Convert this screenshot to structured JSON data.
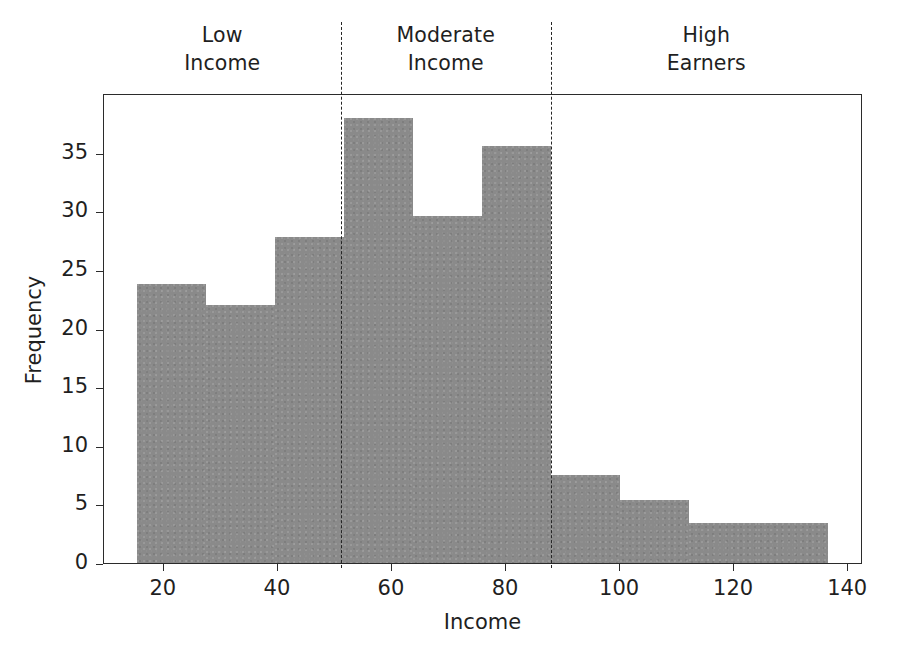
{
  "chart_data": {
    "type": "bar",
    "chart_subtype": "histogram",
    "title": "",
    "xlabel": "Income",
    "ylabel": "Frequency",
    "xlim": [
      9.5,
      142.6
    ],
    "ylim": [
      0,
      40.1
    ],
    "grid": false,
    "legend": null,
    "bar_color": "#8a8a8a",
    "bin_edges": [
      15.2,
      27.3,
      39.4,
      51.5,
      63.6,
      75.7,
      87.8,
      99.9,
      112.0,
      124.1,
      136.5
    ],
    "bin_centers": [
      21.2,
      33.3,
      45.4,
      57.5,
      69.6,
      81.7,
      93.8,
      105.9,
      118.0,
      130.3
    ],
    "values": [
      23.8,
      22.0,
      27.8,
      38.0,
      29.6,
      35.6,
      7.5,
      5.4,
      3.4,
      3.4
    ],
    "xticks": [
      20,
      40,
      60,
      80,
      100,
      120,
      140
    ],
    "xtick_labels": [
      "20",
      "40",
      "60",
      "80",
      "100",
      "120",
      "140"
    ],
    "yticks": [
      0,
      5,
      10,
      15,
      20,
      25,
      30,
      35
    ],
    "ytick_labels": [
      "0",
      "5",
      "10",
      "15",
      "20",
      "25",
      "30",
      "35"
    ],
    "annotations": [
      {
        "kind": "vline",
        "x": 51.2,
        "style": "dashed",
        "color": "#262626"
      },
      {
        "kind": "vline",
        "x": 88.0,
        "style": "dashed",
        "color": "#262626"
      }
    ],
    "regions": [
      {
        "label": "Low\nIncome",
        "x_start": 9.5,
        "x_end": 51.2,
        "center": 30.4
      },
      {
        "label": "Moderate\nIncome",
        "x_start": 51.2,
        "x_end": 88.0,
        "center": 69.6
      },
      {
        "label": "High\nEarners",
        "x_start": 88.0,
        "x_end": 142.6,
        "center": 115.3
      }
    ]
  }
}
